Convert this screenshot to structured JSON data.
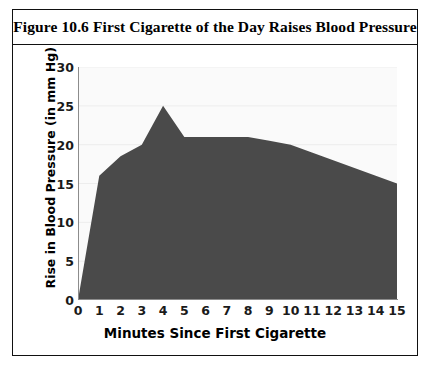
{
  "figure": {
    "title": "Figure 10.6 First Cigarette of the Day Raises Blood Pressure"
  },
  "colors": {
    "area_fill": "#4a4a4a",
    "plot_background": "#fafafa",
    "gridline": "#ededed",
    "axis_line": "#8c8c8c",
    "frame": "#111111",
    "text": "#000000"
  },
  "chart_data": {
    "type": "area",
    "title": "Figure 10.6 First Cigarette of the Day Raises Blood Pressure",
    "xlabel": "Minutes Since First Cigarette",
    "ylabel": "Rise in Blood Pressure (in mm Hg)",
    "x": [
      0,
      1,
      2,
      3,
      4,
      5,
      6,
      7,
      8,
      9,
      10,
      11,
      12,
      13,
      14,
      15
    ],
    "values": [
      0,
      16,
      18.5,
      20,
      25,
      21,
      21,
      21,
      21,
      20.5,
      20,
      19,
      18,
      17,
      16,
      15
    ],
    "xlim": [
      0,
      15
    ],
    "ylim": [
      0,
      30
    ],
    "xticks": [
      "0",
      "1",
      "2",
      "3",
      "4",
      "5",
      "6",
      "7",
      "8",
      "9",
      "10",
      "11",
      "12",
      "13",
      "14",
      "15"
    ],
    "yticks": [
      "0",
      "5",
      "10",
      "15",
      "20",
      "25",
      "30"
    ],
    "ytick_values": [
      0,
      5,
      10,
      15,
      20,
      25,
      30
    ],
    "grid": true,
    "legend": null
  }
}
